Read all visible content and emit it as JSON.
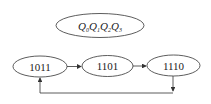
{
  "title": {
    "label": "Q0Q1Q2Q3",
    "parts": [
      {
        "q": "Q",
        "sub": "0"
      },
      {
        "q": "Q",
        "sub": "1"
      },
      {
        "q": "Q",
        "sub": "2"
      },
      {
        "q": "Q",
        "sub": "3"
      }
    ]
  },
  "states": [
    {
      "label": "1011"
    },
    {
      "label": "1101"
    },
    {
      "label": "1110"
    }
  ],
  "transitions": [
    {
      "from": "1011",
      "to": "1101"
    },
    {
      "from": "1101",
      "to": "1110"
    },
    {
      "from": "1110",
      "to": "1011"
    }
  ],
  "colors": {
    "stroke": "#333333",
    "text": "#222222",
    "background": "#ffffff"
  }
}
